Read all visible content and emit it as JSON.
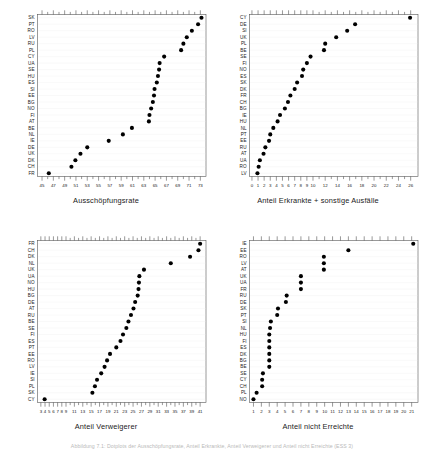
{
  "figure": {
    "caption": "Abbildung 7.1: Dotplots der Ausschöpfungsrate, Anteil Erkrankte, Anteil Verweigerer und Anteil nicht Erreichte (ESS 3)",
    "panel_count": 4
  },
  "chart_data": [
    {
      "id": "ausschoepfungsrate",
      "type": "scatter",
      "plot_style": "cleveland-dotplot",
      "title": "",
      "xlabel": "Ausschöpfungsrate",
      "ylabel": "",
      "xlim": [
        44.2,
        74.0
      ],
      "xticks": [
        45,
        47,
        49,
        51,
        53,
        55,
        57,
        59,
        61,
        63,
        65,
        67,
        69,
        71,
        73
      ],
      "xtick_labels": [
        "45",
        "47",
        "49",
        "51",
        "53",
        "55",
        "57",
        "59",
        "61",
        "63",
        "65",
        "67",
        "69",
        "71",
        "73"
      ],
      "minor_ticks": [
        46,
        48,
        50,
        52,
        54,
        56,
        58,
        60,
        62,
        64,
        66,
        68,
        70,
        72
      ],
      "grid": true,
      "legend": "none",
      "categories": [
        "SK",
        "PT",
        "RO",
        "LV",
        "RU",
        "PL",
        "CY",
        "UA",
        "SE",
        "HU",
        "ES",
        "SI",
        "EE",
        "BG",
        "NO",
        "FI",
        "AT",
        "BE",
        "NL",
        "IE",
        "DE",
        "UK",
        "DK",
        "CH",
        "FR"
      ],
      "values": [
        73.2,
        72.6,
        71.5,
        70.6,
        70.0,
        69.6,
        66.6,
        65.8,
        65.7,
        65.5,
        65.3,
        64.9,
        64.8,
        64.6,
        64.3,
        64.0,
        63.9,
        60.9,
        59.3,
        56.8,
        53.0,
        51.8,
        50.9,
        50.2,
        46.2
      ]
    },
    {
      "id": "anteil-erkrankte",
      "type": "scatter",
      "plot_style": "cleveland-dotplot",
      "title": "",
      "xlabel": "Anteil Erkrankte + sonstige Ausfälle",
      "ylabel": "",
      "xlim": [
        -0.4,
        27.2
      ],
      "xticks": [
        0,
        1,
        2,
        3,
        4,
        5,
        6,
        7,
        8,
        9,
        10,
        12,
        14,
        16,
        18,
        20,
        22,
        24,
        26
      ],
      "xtick_labels": [
        "0",
        "1",
        "2",
        "3",
        "4",
        "5",
        "6",
        "7",
        "8",
        "9",
        "10",
        "12",
        "14",
        "16",
        "18",
        "20",
        "22",
        "24",
        "26"
      ],
      "minor_ticks": [
        11,
        13,
        15,
        17,
        19,
        21,
        23,
        25
      ],
      "grid": true,
      "legend": "none",
      "categories": [
        "CY",
        "DE",
        "SI",
        "UK",
        "PL",
        "BE",
        "SE",
        "FI",
        "NO",
        "ES",
        "SK",
        "DK",
        "FR",
        "CH",
        "BG",
        "IE",
        "HU",
        "NL",
        "PT",
        "EE",
        "RU",
        "AT",
        "UA",
        "RO",
        "LV"
      ],
      "values": [
        25.9,
        16.9,
        15.6,
        13.8,
        12.0,
        11.8,
        9.6,
        9.0,
        8.4,
        8.2,
        7.4,
        7.0,
        6.3,
        5.9,
        5.4,
        4.6,
        4.2,
        3.5,
        3.0,
        2.8,
        2.2,
        1.9,
        1.3,
        1.1,
        0.9
      ]
    },
    {
      "id": "anteil-verweigerer",
      "type": "scatter",
      "plot_style": "cleveland-dotplot",
      "title": "",
      "xlabel": "Anteil Verweigerer",
      "ylabel": "",
      "xlim": [
        2.2,
        42.4
      ],
      "xticks": [
        3,
        4,
        5,
        6,
        7,
        8,
        9,
        11,
        13,
        15,
        17,
        19,
        21,
        23,
        25,
        27,
        29,
        31,
        33,
        35,
        37,
        39,
        41
      ],
      "xtick_labels": [
        "3",
        "4",
        "5",
        "6",
        "7",
        "8",
        "9",
        "11",
        "13",
        "15",
        "17",
        "19",
        "21",
        "23",
        "25",
        "27",
        "29",
        "31",
        "33",
        "35",
        "37",
        "39",
        "41"
      ],
      "minor_ticks": [
        10,
        12,
        14,
        16,
        18,
        20,
        22,
        24,
        26,
        28,
        30,
        32,
        34,
        36,
        38,
        40
      ],
      "grid": true,
      "legend": "none",
      "categories": [
        "FR",
        "CH",
        "DK",
        "NL",
        "UK",
        "UA",
        "NO",
        "HU",
        "BG",
        "DE",
        "AT",
        "RU",
        "BE",
        "SE",
        "FI",
        "ES",
        "PT",
        "EE",
        "RO",
        "LV",
        "IE",
        "SI",
        "PL",
        "SK",
        "CY"
      ],
      "values": [
        41.0,
        40.6,
        38.6,
        34.0,
        27.6,
        26.5,
        26.4,
        26.3,
        26.1,
        25.5,
        25.1,
        24.5,
        23.9,
        23.4,
        22.6,
        22.0,
        21.0,
        19.5,
        18.8,
        18.2,
        17.4,
        16.4,
        15.9,
        15.3,
        3.9
      ]
    },
    {
      "id": "anteil-nicht-erreichte",
      "type": "scatter",
      "plot_style": "cleveland-dotplot",
      "title": "",
      "xlabel": "Anteil nicht Erreichte",
      "ylabel": "",
      "xlim": [
        0.5,
        21.8
      ],
      "xticks": [
        1,
        2,
        3,
        4,
        5,
        6,
        7,
        8,
        9,
        10,
        11,
        12,
        13,
        14,
        15,
        16,
        17,
        18,
        19,
        20,
        21
      ],
      "xtick_labels": [
        "1",
        "2",
        "3",
        "4",
        "5",
        "6",
        "7",
        "8",
        "9",
        "10",
        "11",
        "12",
        "13",
        "14",
        "15",
        "16",
        "17",
        "18",
        "19",
        "20",
        "21"
      ],
      "minor_ticks": [],
      "grid": true,
      "legend": "none",
      "categories": [
        "IE",
        "EE",
        "RO",
        "LV",
        "AT",
        "UK",
        "UA",
        "FR",
        "RU",
        "DE",
        "SK",
        "PT",
        "SI",
        "NL",
        "HU",
        "FI",
        "ES",
        "DK",
        "BG",
        "BE",
        "SE",
        "CY",
        "CH",
        "PL",
        "NO"
      ],
      "values": [
        21.2,
        13.0,
        9.9,
        9.9,
        9.9,
        7.0,
        7.0,
        7.0,
        5.2,
        5.1,
        4.1,
        4.0,
        3.2,
        3.1,
        3.0,
        3.0,
        3.0,
        3.0,
        3.0,
        3.0,
        2.2,
        2.1,
        2.1,
        1.4,
        1.0
      ]
    }
  ]
}
